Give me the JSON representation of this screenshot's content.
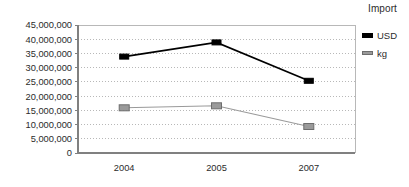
{
  "chart_data": {
    "type": "line",
    "title": "Import",
    "xlabel": "",
    "ylabel": "",
    "categories": [
      "2004",
      "2005",
      "2007"
    ],
    "series": [
      {
        "name": "USD",
        "color": "#000000",
        "values": [
          33900000,
          38900000,
          25400000
        ]
      },
      {
        "name": "kg",
        "color": "#9a9a9a",
        "values": [
          15900000,
          16600000,
          9300000
        ]
      }
    ],
    "ylim": [
      0,
      45000000
    ],
    "ytick_values": [
      0,
      5000000,
      10000000,
      15000000,
      20000000,
      25000000,
      30000000,
      35000000,
      40000000,
      45000000
    ],
    "ytick_labels": [
      "0",
      "5,000,000",
      "10,000,000",
      "15,000,000",
      "20,000,000",
      "25,000,000",
      "30,000,000",
      "35,000,000",
      "40,000,000",
      "45,000,000"
    ],
    "grid": true,
    "grid_style": "dotted-horizontal",
    "legend_position": "right",
    "marker": "square"
  },
  "legend": {
    "items": [
      {
        "label": "USD",
        "swatch": "usd"
      },
      {
        "label": "kg",
        "swatch": "kg"
      }
    ]
  },
  "colors": {
    "usd": "#000000",
    "kg": "#9a9a9a",
    "kg_edge": "#6d6d6d",
    "axis": "#808080",
    "grid": "#b8b8b8",
    "text": "#2b2b2b"
  }
}
